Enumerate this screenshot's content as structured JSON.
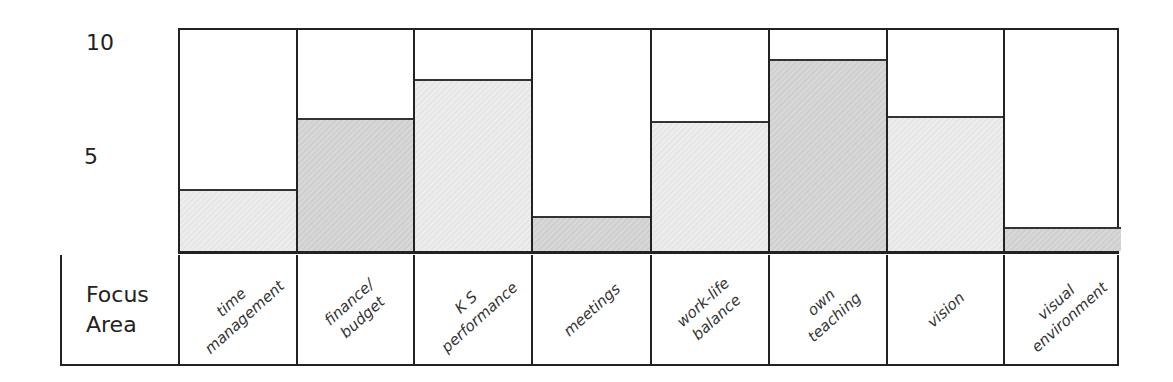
{
  "chart_data": {
    "type": "bar",
    "title": "",
    "xlabel": "Focus Area",
    "ylabel": "",
    "ylim": [
      0,
      10
    ],
    "yticks": [
      5,
      10
    ],
    "grid": false,
    "legend": null,
    "categories": [
      "time management",
      "finance/ budget",
      "K S performance",
      "meetings",
      "work-life balance",
      "own teaching",
      "vision",
      "visual environment"
    ],
    "values": [
      2.8,
      6.0,
      7.8,
      1.6,
      5.9,
      8.7,
      6.1,
      1.1
    ],
    "fills": [
      "light",
      "dark",
      "light",
      "dark",
      "light",
      "dark",
      "light",
      "dark"
    ],
    "colors": {
      "light": "#ebebeb",
      "dark": "#d5d5d5",
      "border": "#222222"
    }
  },
  "axis": {
    "tick_10": "10",
    "tick_5": "5"
  },
  "row_header": {
    "line1": "Focus",
    "line2": "Area"
  },
  "labels": [
    {
      "line1": "time",
      "line2": "management"
    },
    {
      "line1": "finance/",
      "line2": "budget"
    },
    {
      "line1": "K S",
      "line2": "performance"
    },
    {
      "line1": "meetings",
      "line2": ""
    },
    {
      "line1": "work-life",
      "line2": "balance"
    },
    {
      "line1": "own",
      "line2": "teaching"
    },
    {
      "line1": "vision",
      "line2": ""
    },
    {
      "line1": "visual",
      "line2": "environment"
    }
  ]
}
